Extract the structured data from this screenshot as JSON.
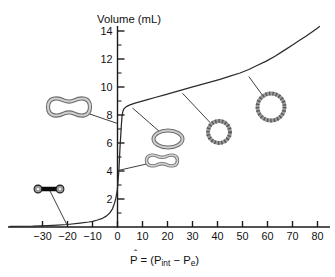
{
  "figure": {
    "y_title": "Volume (mL)",
    "x_title": {
      "p": "P",
      "hat": "ˆ",
      "mid": " = (P",
      "sub_int": "int",
      "mid2": " − P",
      "sub_e": "e",
      "end": ")"
    },
    "colors": {
      "background": "#ffffff",
      "text": "#111111",
      "axis": "#1a1a1a",
      "curve": "#2b2b2b",
      "leader": "#3f3f3f",
      "icon_wall_dark": "#6e6e6e",
      "icon_wall_light": "#cfcfcf",
      "icon_wall_mid": "#9a9a9a",
      "icon_stipple": "#555555",
      "collapsed_tube": "#0a0a0a"
    }
  },
  "chart_data": {
    "type": "line",
    "title": "",
    "xlabel": "P̂ = (Pint − Pe)",
    "ylabel": "Volume (mL)",
    "xlim": [
      -43,
      85
    ],
    "ylim": [
      0,
      14.8
    ],
    "grid": false,
    "legend": null,
    "x_ticks": [
      -30,
      -20,
      -10,
      0,
      10,
      20,
      30,
      40,
      50,
      60,
      70,
      80
    ],
    "y_ticks": [
      2,
      4,
      6,
      8,
      10,
      12,
      14
    ],
    "y_minor_ticks": [
      1,
      3,
      5,
      7,
      9,
      11,
      13
    ],
    "series": [
      {
        "name": "pressure-volume-curve",
        "points": [
          [
            -43,
            0.04
          ],
          [
            -34,
            0.06
          ],
          [
            -28,
            0.09
          ],
          [
            -24,
            0.13
          ],
          [
            -20,
            0.18
          ],
          [
            -15,
            0.28
          ],
          [
            -11.5,
            0.36
          ],
          [
            -10,
            0.4
          ],
          [
            -8,
            0.5
          ],
          [
            -6,
            0.62
          ],
          [
            -4.5,
            0.78
          ],
          [
            -3,
            1.02
          ],
          [
            -2,
            1.3
          ],
          [
            -1.2,
            1.7
          ],
          [
            -0.6,
            2.1
          ],
          [
            -0.1,
            2.65
          ],
          [
            0.25,
            3.3
          ],
          [
            0.55,
            4.05
          ],
          [
            0.8,
            4.9
          ],
          [
            1.05,
            5.8
          ],
          [
            1.3,
            6.6
          ],
          [
            1.55,
            7.3
          ],
          [
            1.8,
            7.9
          ],
          [
            2.1,
            8.25
          ],
          [
            2.6,
            8.45
          ],
          [
            3.5,
            8.6
          ],
          [
            5,
            8.72
          ],
          [
            7,
            8.84
          ],
          [
            9.5,
            8.97
          ],
          [
            12,
            9.1
          ],
          [
            15,
            9.25
          ],
          [
            18.5,
            9.42
          ],
          [
            22,
            9.6
          ],
          [
            25.5,
            9.78
          ],
          [
            29,
            9.95
          ],
          [
            33,
            10.15
          ],
          [
            37,
            10.35
          ],
          [
            41,
            10.55
          ],
          [
            45,
            10.77
          ],
          [
            49,
            11.0
          ],
          [
            52.5,
            11.25
          ],
          [
            56,
            11.55
          ],
          [
            59.5,
            11.85
          ],
          [
            63,
            12.2
          ],
          [
            66.5,
            12.6
          ],
          [
            70,
            13.0
          ],
          [
            73,
            13.35
          ],
          [
            75.5,
            13.65
          ],
          [
            77.5,
            13.9
          ],
          [
            79.5,
            14.15
          ],
          [
            80.8,
            14.32
          ]
        ]
      }
    ],
    "annotations": [
      {
        "shape": "collapsed-tube",
        "attach_P": -20.3,
        "attach_V": 0.17,
        "cx": 49,
        "cy": 189,
        "w": 26,
        "h": 8
      },
      {
        "shape": "pinched-peanut",
        "attach_P": -0.1,
        "attach_V": 7.4,
        "cx": 69,
        "cy": 107,
        "w": 42,
        "h": 17
      },
      {
        "shape": "long-peanut",
        "attach_P": 0.55,
        "attach_V": 4.05,
        "cx": 162,
        "cy": 160.5,
        "w": 31,
        "h": 10
      },
      {
        "shape": "open-oval",
        "attach_P": 6,
        "attach_V": 8.5,
        "cx": 168,
        "cy": 139,
        "rx": 14.5,
        "ry": 8.5
      },
      {
        "shape": "stippled-circle",
        "attach_P": 26,
        "attach_V": 9.55,
        "cx": 219,
        "cy": 132,
        "r": 11
      },
      {
        "shape": "stippled-circle",
        "attach_P": 52.5,
        "attach_V": 10.75,
        "cx": 271,
        "cy": 107,
        "r": 13.5
      }
    ]
  }
}
